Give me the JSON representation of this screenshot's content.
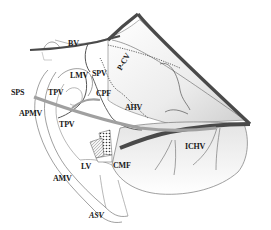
{
  "diagram": {
    "type": "anatomical-illustration",
    "labels": [
      {
        "id": "bv",
        "text": "BV",
        "x": 68,
        "y": 47
      },
      {
        "id": "lmv",
        "text": "LMV",
        "x": 70,
        "y": 76
      },
      {
        "id": "spv",
        "text": "SPV",
        "x": 92,
        "y": 75
      },
      {
        "id": "pcv",
        "text": "P-CV",
        "x": 116,
        "y": 76
      },
      {
        "id": "sps",
        "text": "SPS",
        "x": 11,
        "y": 91
      },
      {
        "id": "tpv1",
        "text": "TPV",
        "x": 48,
        "y": 92
      },
      {
        "id": "cpf",
        "text": "CPF",
        "x": 96,
        "y": 93
      },
      {
        "id": "apmv",
        "text": "APMV",
        "x": 19,
        "y": 113
      },
      {
        "id": "ahv",
        "text": "AHV",
        "x": 125,
        "y": 107
      },
      {
        "id": "tpv2",
        "text": "TPV",
        "x": 59,
        "y": 124
      },
      {
        "id": "ichv",
        "text": "ICHV",
        "x": 185,
        "y": 145
      },
      {
        "id": "cmf",
        "text": "CMF",
        "x": 113,
        "y": 165
      },
      {
        "id": "lv",
        "text": "LV",
        "x": 81,
        "y": 166
      },
      {
        "id": "amv",
        "text": "AMV",
        "x": 53,
        "y": 178
      },
      {
        "id": "asv",
        "text": "ASV",
        "x": 89,
        "y": 215
      }
    ],
    "colors": {
      "line": "#555555",
      "thick_line": "#4a4a4a",
      "gray_bar": "#9a9a9a",
      "fill_light": "#f2f2f2",
      "fill_shade": "#d9d9d9",
      "text": "#1a1a1a"
    }
  }
}
